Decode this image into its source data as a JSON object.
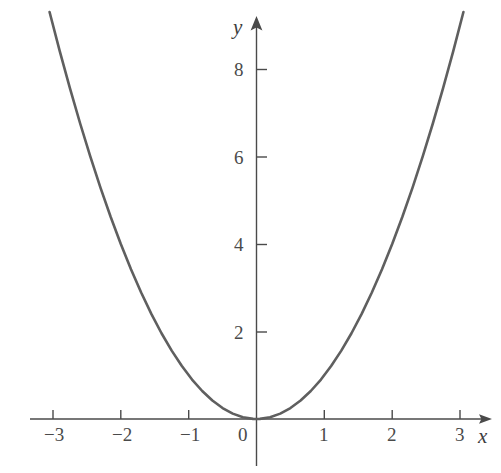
{
  "chart_data": {
    "type": "line",
    "title": "",
    "subtitle": "",
    "xlabel": "x",
    "ylabel": "y",
    "xlim": [
      -3.1,
      3.1
    ],
    "ylim": [
      -0.3,
      9.3
    ],
    "grid": false,
    "legend": null,
    "legend_position": "none",
    "xticks": [
      -3,
      -2,
      -1,
      0,
      1,
      2,
      3
    ],
    "xtick_labels": [
      "−3",
      "−2",
      "−1",
      "0",
      "1",
      "2",
      "3"
    ],
    "yticks": [
      2,
      4,
      6,
      8
    ],
    "ytick_labels": [
      "2",
      "4",
      "6",
      "8"
    ],
    "series": [
      {
        "name": "y = x^2",
        "equation": "y = x²",
        "color": "#5f5f5f",
        "linewidth": 2.6,
        "x": [
          -3.05,
          -2.9,
          -2.75,
          -2.6,
          -2.45,
          -2.3,
          -2.15,
          -2.0,
          -1.85,
          -1.7,
          -1.55,
          -1.4,
          -1.25,
          -1.1,
          -0.95,
          -0.8,
          -0.65,
          -0.5,
          -0.35,
          -0.2,
          -0.05,
          0.0,
          0.05,
          0.2,
          0.35,
          0.5,
          0.65,
          0.8,
          0.95,
          1.1,
          1.25,
          1.4,
          1.55,
          1.7,
          1.85,
          2.0,
          2.15,
          2.3,
          2.45,
          2.6,
          2.75,
          2.9,
          3.05
        ],
        "y": [
          9.3025,
          8.41,
          7.5625,
          6.76,
          6.0025,
          5.29,
          4.6225,
          4.0,
          3.4225,
          2.89,
          2.4025,
          1.96,
          1.5625,
          1.21,
          0.9025,
          0.64,
          0.4225,
          0.25,
          0.1225,
          0.04,
          0.0025,
          0.0,
          0.0025,
          0.04,
          0.1225,
          0.25,
          0.4225,
          0.64,
          0.9025,
          1.21,
          1.5625,
          1.96,
          2.4025,
          2.89,
          3.4225,
          4.0,
          4.6225,
          5.29,
          6.0025,
          6.76,
          7.5625,
          8.41,
          9.3025
        ]
      }
    ],
    "axis_style": {
      "color": "#4a4a4a",
      "linewidth": 1.3,
      "x_arrow": true,
      "y_arrow": true,
      "spines": "centered-cross"
    }
  },
  "labels": {
    "x_axis_name": "x",
    "y_axis_name": "y",
    "xtick_neg3": "−3",
    "xtick_neg2": "−2",
    "xtick_neg1": "−1",
    "xtick_0": "0",
    "xtick_1": "1",
    "xtick_2": "2",
    "xtick_3": "3",
    "ytick_2": "2",
    "ytick_4": "4",
    "ytick_6": "6",
    "ytick_8": "8"
  },
  "colors": {
    "curve": "#5f5f5f",
    "axis": "#4a4a4a",
    "text": "#4a4a4a",
    "background": "#ffffff"
  }
}
